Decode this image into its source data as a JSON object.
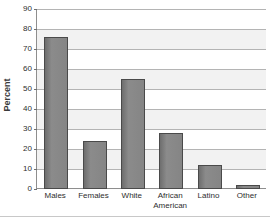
{
  "chart_data": {
    "type": "bar",
    "title": "",
    "subtitle": "",
    "xlabel": "",
    "ylabel": "Percent",
    "categories": [
      "Males",
      "Females",
      "White",
      "African American",
      "Latino",
      "Other"
    ],
    "values": [
      76,
      24,
      55,
      28,
      12,
      2
    ],
    "ylim": [
      0,
      90
    ],
    "ytick_step": 10,
    "yticks": [
      "90",
      "80",
      "70",
      "60",
      "50",
      "40",
      "30",
      "20",
      "10",
      "0"
    ],
    "grid": true,
    "legend": "none",
    "bar_color": "#7a7a7a",
    "bar_border_color": "#4a4a4a",
    "band_color": "#f2f2f2",
    "gridline_color": "#b4b4b4",
    "axis_color": "#8e8e8e",
    "text_color": "#2e2e2e",
    "background": "#ffffff"
  },
  "axis": {
    "y_title": "Percent"
  }
}
